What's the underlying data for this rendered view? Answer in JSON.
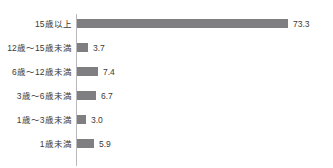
{
  "chart_data": {
    "type": "bar",
    "orientation": "horizontal",
    "title": "",
    "xlabel": "",
    "ylabel": "",
    "categories": [
      "15歳以上",
      "12歳～15歳未満",
      "6歳～12歳未満",
      "3歳～6歳未満",
      "1歳～3歳未満",
      "1歳未満"
    ],
    "values": [
      73.3,
      3.7,
      7.4,
      6.7,
      3.0,
      5.9
    ],
    "value_labels": [
      "73.3",
      "3.7",
      "7.4",
      "6.7",
      "3.0",
      "5.9"
    ],
    "xlim": [
      0,
      73.3
    ],
    "grid": false,
    "legend": null,
    "bar_color": "#7f7f82",
    "axis_color": "#b9b9bd",
    "text_color": "#3a3a3a"
  },
  "clipped_header": {
    "text": ""
  }
}
